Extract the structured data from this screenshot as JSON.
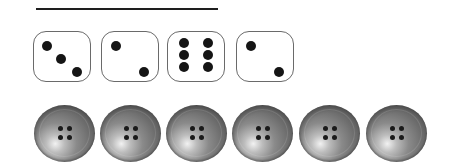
{
  "worksheet": {
    "answer_line": {
      "visible": true
    },
    "dice": [
      {
        "value": 3,
        "pips": [
          [
            8,
            9
          ],
          [
            22,
            22
          ],
          [
            38,
            35
          ]
        ]
      },
      {
        "value": 2,
        "pips": [
          [
            9,
            9
          ],
          [
            37,
            35
          ]
        ]
      },
      {
        "value": 6,
        "pips": [
          [
            11,
            6
          ],
          [
            11,
            18
          ],
          [
            11,
            30
          ],
          [
            35,
            6
          ],
          [
            35,
            18
          ],
          [
            35,
            30
          ]
        ]
      },
      {
        "value": 2,
        "pips": [
          [
            9,
            9
          ],
          [
            37,
            35
          ]
        ]
      }
    ],
    "dice_x": [
      0,
      68,
      134,
      203
    ],
    "buttons": [
      {
        "holes": 4
      },
      {
        "holes": 4
      },
      {
        "holes": 4
      },
      {
        "holes": 4
      },
      {
        "holes": 4
      },
      {
        "holes": 4
      }
    ],
    "buttons_x": [
      0,
      66,
      132,
      198,
      265,
      332
    ],
    "colors": {
      "line": "#1e1e1e",
      "die_border": "#6a6a6a",
      "pip": "#151515",
      "button": "#6e6e6e"
    }
  }
}
